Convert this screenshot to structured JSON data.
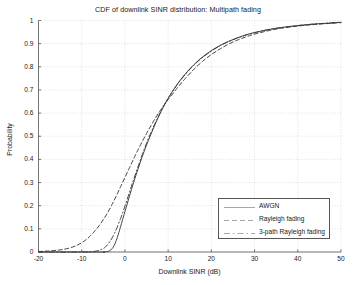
{
  "chart_data": {
    "type": "line",
    "title": "CDF of downlink SINR distribution: Multipath fading",
    "xlabel": "Downlink SINR (dB)",
    "ylabel": "Probability",
    "xlim": [
      -20,
      50
    ],
    "ylim": [
      0,
      1
    ],
    "xticks": [
      "-20",
      "-10",
      "0",
      "10",
      "20",
      "30",
      "40",
      "50"
    ],
    "xtick_values": [
      -20,
      -10,
      0,
      10,
      20,
      30,
      40,
      50
    ],
    "yticks": [
      "0",
      "0.1",
      "0.2",
      "0.3",
      "0.4",
      "0.5",
      "0.6",
      "0.7",
      "0.8",
      "0.9",
      "1"
    ],
    "ytick_values": [
      0,
      0.1,
      0.2,
      0.3,
      0.4,
      0.5,
      0.6,
      0.7,
      0.8,
      0.9,
      1
    ],
    "grid": true,
    "legend_position": "lower right",
    "line_color": "#3a3a3a",
    "grid_color": "#cccccc",
    "series": [
      {
        "name": "AWGN",
        "style": "solid",
        "x": [
          -20,
          -6,
          -5,
          -4,
          -3.5,
          -3,
          -2.5,
          -2,
          -1.5,
          -1,
          0,
          1,
          2,
          3,
          4,
          5,
          6,
          7,
          8,
          9,
          10,
          12,
          14,
          16,
          18,
          20,
          22,
          24,
          26,
          28,
          30,
          33,
          36,
          40,
          44,
          47,
          50
        ],
        "y": [
          0,
          0,
          0,
          0.002,
          0.006,
          0.014,
          0.028,
          0.05,
          0.078,
          0.11,
          0.175,
          0.238,
          0.3,
          0.357,
          0.412,
          0.462,
          0.508,
          0.552,
          0.593,
          0.63,
          0.664,
          0.722,
          0.77,
          0.81,
          0.843,
          0.87,
          0.892,
          0.91,
          0.925,
          0.938,
          0.948,
          0.96,
          0.969,
          0.978,
          0.985,
          0.988,
          0.992
        ]
      },
      {
        "name": "Rayleigh fading",
        "style": "dashed",
        "x": [
          -20,
          -18,
          -16,
          -14,
          -12,
          -11,
          -10,
          -9,
          -8,
          -7,
          -6,
          -5,
          -4,
          -3,
          -2,
          -1,
          0,
          1,
          2,
          3,
          4,
          5,
          6,
          7,
          8,
          9,
          10,
          12,
          14,
          16,
          18,
          20,
          22,
          24,
          26,
          28,
          30,
          33,
          36,
          40,
          44,
          47,
          50
        ],
        "y": [
          0.002,
          0.004,
          0.007,
          0.012,
          0.022,
          0.03,
          0.04,
          0.053,
          0.07,
          0.09,
          0.113,
          0.14,
          0.17,
          0.205,
          0.242,
          0.282,
          0.322,
          0.362,
          0.402,
          0.44,
          0.477,
          0.512,
          0.545,
          0.577,
          0.606,
          0.633,
          0.658,
          0.706,
          0.75,
          0.79,
          0.824,
          0.853,
          0.877,
          0.898,
          0.915,
          0.929,
          0.941,
          0.955,
          0.966,
          0.976,
          0.983,
          0.987,
          0.991
        ]
      },
      {
        "name": "3-path Rayleigh fading",
        "style": "dashdot",
        "x": [
          -20,
          -10,
          -8,
          -7,
          -6,
          -5,
          -4.5,
          -4,
          -3.5,
          -3,
          -2.5,
          -2,
          -1,
          0,
          1,
          2,
          3,
          4,
          5,
          6,
          7,
          8,
          9,
          10,
          12,
          14,
          16,
          18,
          20,
          22,
          24,
          26,
          28,
          30,
          33,
          36,
          40,
          44,
          47,
          50
        ],
        "y": [
          0,
          0,
          0.001,
          0.003,
          0.007,
          0.015,
          0.022,
          0.032,
          0.045,
          0.06,
          0.078,
          0.098,
          0.145,
          0.198,
          0.255,
          0.312,
          0.367,
          0.42,
          0.47,
          0.515,
          0.557,
          0.596,
          0.632,
          0.664,
          0.72,
          0.768,
          0.808,
          0.841,
          0.868,
          0.891,
          0.909,
          0.924,
          0.937,
          0.947,
          0.96,
          0.969,
          0.978,
          0.985,
          0.989,
          0.993
        ]
      }
    ]
  },
  "legend": {
    "items": [
      {
        "label": "AWGN",
        "style": "solid"
      },
      {
        "label": "Rayleigh fading",
        "style": "dashed"
      },
      {
        "label": "3-path Rayleigh fading",
        "style": "dashdot"
      }
    ]
  }
}
